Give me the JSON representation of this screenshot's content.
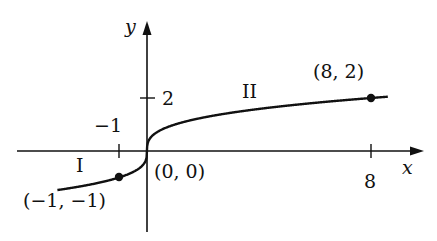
{
  "chart_data": {
    "type": "line",
    "title": "",
    "function": "y = x^(1/3)",
    "xlabel": "x",
    "ylabel": "y",
    "xlim": [
      -4.6,
      9.8
    ],
    "ylim": [
      -3.1,
      4.9
    ],
    "grid": false,
    "x_ticks": [
      {
        "value": -1,
        "label": "−1"
      },
      {
        "value": 8,
        "label": "8"
      }
    ],
    "y_ticks": [
      {
        "value": 2,
        "label": "2"
      }
    ],
    "series": [
      {
        "name": "y = cube root of x",
        "x": [
          -3.2,
          -1,
          -0.5,
          -0.125,
          0,
          0.125,
          0.5,
          1,
          2,
          4,
          6,
          8,
          8.6
        ],
        "values": [
          -1.474,
          -1,
          -0.794,
          -0.5,
          0,
          0.5,
          0.794,
          1,
          1.26,
          1.587,
          1.817,
          2,
          2.049
        ]
      }
    ],
    "points": [
      {
        "x": -1,
        "y": -1,
        "label": "(−1, −1)",
        "filled": true
      },
      {
        "x": 0,
        "y": 0,
        "label": "(0, 0)",
        "filled": false
      },
      {
        "x": 8,
        "y": 2,
        "label": "(8, 2)",
        "filled": true
      }
    ],
    "annotations": [
      {
        "text": "I",
        "region": "left segment"
      },
      {
        "text": "II",
        "region": "right segment"
      }
    ]
  },
  "labels": {
    "x_axis": "x",
    "y_axis": "y",
    "tick_neg1": "−1",
    "tick_8": "8",
    "tick_2": "2",
    "pt_neg": "(−1, −1)",
    "pt_origin": "(0, 0)",
    "pt_8_2": "(8, 2)",
    "region_I": "I",
    "region_II": "II"
  }
}
